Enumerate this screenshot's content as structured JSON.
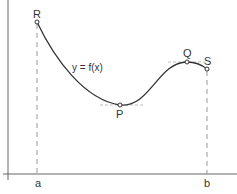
{
  "diagram": {
    "function_label": "y = f(x)",
    "points": {
      "R": {
        "label": "R",
        "x": 37,
        "y": 22
      },
      "P": {
        "label": "P",
        "x": 120,
        "y": 105
      },
      "Q": {
        "label": "Q",
        "x": 187,
        "y": 62
      },
      "S": {
        "label": "S",
        "x": 207,
        "y": 69
      }
    },
    "x_axis_labels": {
      "a": "a",
      "b": "b"
    },
    "colors": {
      "curve": "#333333",
      "axis": "#555555",
      "dashed": "#999999",
      "tangent": "#bbbbbb"
    }
  }
}
